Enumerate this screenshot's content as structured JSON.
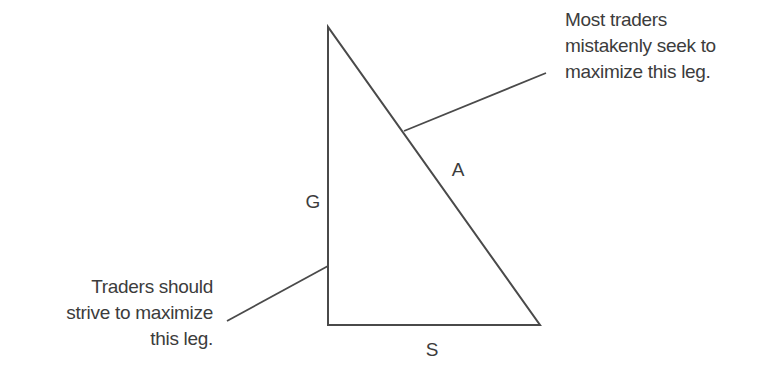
{
  "diagram": {
    "type": "right-triangle-annotation",
    "stroke_color": "#4a4a4a",
    "text_color": "#3c3c3c",
    "triangle": {
      "vertices": {
        "top": [
          328,
          27
        ],
        "bottom_left": [
          328,
          325
        ],
        "bottom_right": [
          540,
          325
        ]
      },
      "legs": [
        {
          "id": "G",
          "label": "G",
          "side": "vertical",
          "label_pos": [
            313,
            202
          ]
        },
        {
          "id": "A",
          "label": "A",
          "side": "hypotenuse",
          "label_pos": [
            458,
            170
          ]
        },
        {
          "id": "S",
          "label": "S",
          "side": "horizontal",
          "label_pos": [
            432,
            350
          ]
        }
      ]
    },
    "callouts": [
      {
        "id": "top",
        "points_to": "A",
        "line": [
          [
            404,
            131
          ],
          [
            546,
            73
          ]
        ],
        "lines": [
          "Most traders",
          "mistakenly seek to",
          "maximize this leg."
        ]
      },
      {
        "id": "bottom",
        "points_to": "G",
        "line": [
          [
            227,
            321
          ],
          [
            328,
            266
          ]
        ],
        "lines": [
          "Traders should",
          "strive to maximize",
          "this leg."
        ]
      }
    ]
  }
}
